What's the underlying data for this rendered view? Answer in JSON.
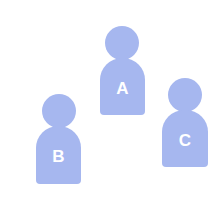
{
  "colors": {
    "figure": "#a6b7ef",
    "label": "#ffffff",
    "background": "#ffffff"
  },
  "figures": [
    {
      "label": "A",
      "head": {
        "cx": 122,
        "cy": 43,
        "r": 17
      },
      "body": {
        "x": 100,
        "y": 58,
        "w": 45,
        "h": 57
      }
    },
    {
      "label": "B",
      "head": {
        "cx": 59,
        "cy": 111,
        "r": 17
      },
      "body": {
        "x": 36,
        "y": 126,
        "w": 45,
        "h": 58
      }
    },
    {
      "label": "C",
      "head": {
        "cx": 185,
        "cy": 95,
        "r": 17
      },
      "body": {
        "x": 162,
        "y": 110,
        "w": 46,
        "h": 57
      }
    }
  ]
}
